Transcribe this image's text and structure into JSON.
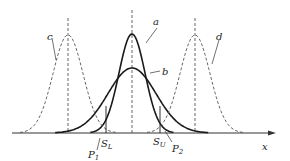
{
  "figure": {
    "type": "normal-distribution-diagram",
    "axis_label": "x",
    "curves": [
      {
        "id": "a",
        "label": "a",
        "style": "solid",
        "center_x": 132,
        "peak_y": 34,
        "sigma": 13
      },
      {
        "id": "b",
        "label": "b",
        "style": "solid",
        "center_x": 132,
        "peak_y": 68,
        "sigma": 24
      },
      {
        "id": "c",
        "label": "c",
        "style": "dashed",
        "center_x": 68,
        "peak_y": 35,
        "sigma": 15
      },
      {
        "id": "d",
        "label": "d",
        "style": "dashed",
        "center_x": 195,
        "peak_y": 35,
        "sigma": 15
      }
    ],
    "limits": [
      {
        "label_main": "S",
        "label_sub": "L",
        "x": 106
      },
      {
        "label_main": "S",
        "label_sub": "U",
        "x": 160
      }
    ],
    "points": [
      {
        "label_main": "P",
        "label_sub": "1"
      },
      {
        "label_main": "P",
        "label_sub": "2"
      }
    ],
    "colors": {
      "line": "#1a1a1a",
      "dashed": "#555555",
      "axis": "#333333"
    }
  }
}
